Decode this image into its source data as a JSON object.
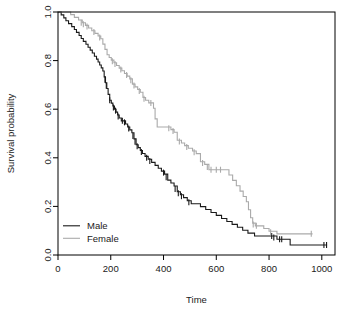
{
  "chart_data": {
    "type": "line",
    "plot_style": "kaplan-meier-step",
    "title": "",
    "xlabel": "Time",
    "ylabel": "Survival probability",
    "xlim": [
      0,
      1050
    ],
    "ylim": [
      0,
      1.0
    ],
    "xticks": [
      0,
      200,
      400,
      600,
      800,
      1000
    ],
    "xtick_labels": [
      "0",
      "200",
      "400",
      "600",
      "800",
      "1000"
    ],
    "yticks": [
      0.0,
      0.2,
      0.4,
      0.6,
      0.8,
      1.0
    ],
    "ytick_labels": [
      "0.0",
      "0.2",
      "0.4",
      "0.6",
      "0.8",
      "1.0"
    ],
    "grid": false,
    "legend_position": "bottom-left",
    "series": [
      {
        "name": "Male",
        "color": "#1a1a1a",
        "line_width": 1.1,
        "steps": [
          [
            0,
            1.0
          ],
          [
            12,
            0.988
          ],
          [
            22,
            0.976
          ],
          [
            30,
            0.964
          ],
          [
            40,
            0.952
          ],
          [
            52,
            0.94
          ],
          [
            62,
            0.928
          ],
          [
            70,
            0.916
          ],
          [
            80,
            0.903
          ],
          [
            88,
            0.891
          ],
          [
            96,
            0.879
          ],
          [
            106,
            0.867
          ],
          [
            114,
            0.855
          ],
          [
            122,
            0.843
          ],
          [
            130,
            0.831
          ],
          [
            138,
            0.818
          ],
          [
            146,
            0.806
          ],
          [
            152,
            0.794
          ],
          [
            158,
            0.782
          ],
          [
            164,
            0.77
          ],
          [
            170,
            0.757
          ],
          [
            175,
            0.733
          ],
          [
            180,
            0.709
          ],
          [
            185,
            0.685
          ],
          [
            190,
            0.661
          ],
          [
            196,
            0.637
          ],
          [
            202,
            0.625
          ],
          [
            208,
            0.613
          ],
          [
            214,
            0.6
          ],
          [
            220,
            0.588
          ],
          [
            226,
            0.576
          ],
          [
            232,
            0.564
          ],
          [
            240,
            0.552
          ],
          [
            248,
            0.552
          ],
          [
            256,
            0.539
          ],
          [
            264,
            0.527
          ],
          [
            272,
            0.515
          ],
          [
            280,
            0.503
          ],
          [
            288,
            0.478
          ],
          [
            296,
            0.454
          ],
          [
            304,
            0.442
          ],
          [
            312,
            0.43
          ],
          [
            320,
            0.418
          ],
          [
            330,
            0.406
          ],
          [
            342,
            0.394
          ],
          [
            355,
            0.381
          ],
          [
            368,
            0.369
          ],
          [
            380,
            0.357
          ],
          [
            392,
            0.345
          ],
          [
            404,
            0.333
          ],
          [
            416,
            0.308
          ],
          [
            428,
            0.296
          ],
          [
            440,
            0.284
          ],
          [
            452,
            0.26
          ],
          [
            464,
            0.248
          ],
          [
            476,
            0.236
          ],
          [
            490,
            0.223
          ],
          [
            505,
            0.211
          ],
          [
            520,
            0.211
          ],
          [
            540,
            0.199
          ],
          [
            560,
            0.187
          ],
          [
            580,
            0.175
          ],
          [
            600,
            0.163
          ],
          [
            620,
            0.15
          ],
          [
            640,
            0.138
          ],
          [
            660,
            0.126
          ],
          [
            680,
            0.114
          ],
          [
            700,
            0.102
          ],
          [
            720,
            0.09
          ],
          [
            745,
            0.078
          ],
          [
            770,
            0.078
          ],
          [
            800,
            0.078
          ],
          [
            830,
            0.065
          ],
          [
            860,
            0.065
          ],
          [
            880,
            0.041
          ],
          [
            1020,
            0.041
          ]
        ],
        "censor_marks": [
          [
            178,
            0.721
          ],
          [
            183,
            0.697
          ],
          [
            196,
            0.637
          ],
          [
            210,
            0.607
          ],
          [
            218,
            0.594
          ],
          [
            228,
            0.57
          ],
          [
            244,
            0.552
          ],
          [
            252,
            0.546
          ],
          [
            268,
            0.521
          ],
          [
            284,
            0.49
          ],
          [
            292,
            0.466
          ],
          [
            300,
            0.448
          ],
          [
            316,
            0.424
          ],
          [
            336,
            0.4
          ],
          [
            348,
            0.387
          ],
          [
            400,
            0.339
          ],
          [
            410,
            0.32
          ],
          [
            444,
            0.272
          ],
          [
            456,
            0.254
          ],
          [
            468,
            0.242
          ],
          [
            496,
            0.217
          ],
          [
            810,
            0.078
          ],
          [
            818,
            0.072
          ],
          [
            840,
            0.065
          ],
          [
            848,
            0.065
          ],
          [
            1008,
            0.041
          ],
          [
            1018,
            0.041
          ]
        ]
      },
      {
        "name": "Female",
        "color": "#aaaaaa",
        "line_width": 1.1,
        "steps": [
          [
            0,
            1.0
          ],
          [
            40,
            1.0
          ],
          [
            48,
            0.989
          ],
          [
            62,
            0.978
          ],
          [
            78,
            0.967
          ],
          [
            92,
            0.956
          ],
          [
            104,
            0.945
          ],
          [
            116,
            0.934
          ],
          [
            128,
            0.923
          ],
          [
            140,
            0.912
          ],
          [
            152,
            0.901
          ],
          [
            162,
            0.89
          ],
          [
            170,
            0.868
          ],
          [
            178,
            0.846
          ],
          [
            186,
            0.824
          ],
          [
            194,
            0.813
          ],
          [
            202,
            0.802
          ],
          [
            212,
            0.791
          ],
          [
            222,
            0.78
          ],
          [
            232,
            0.769
          ],
          [
            242,
            0.758
          ],
          [
            252,
            0.747
          ],
          [
            262,
            0.736
          ],
          [
            272,
            0.725
          ],
          [
            282,
            0.703
          ],
          [
            292,
            0.692
          ],
          [
            302,
            0.681
          ],
          [
            312,
            0.67
          ],
          [
            322,
            0.648
          ],
          [
            332,
            0.637
          ],
          [
            344,
            0.626
          ],
          [
            356,
            0.626
          ],
          [
            362,
            0.604
          ],
          [
            368,
            0.56
          ],
          [
            376,
            0.527
          ],
          [
            392,
            0.527
          ],
          [
            410,
            0.527
          ],
          [
            428,
            0.516
          ],
          [
            440,
            0.505
          ],
          [
            452,
            0.472
          ],
          [
            468,
            0.461
          ],
          [
            480,
            0.45
          ],
          [
            494,
            0.439
          ],
          [
            510,
            0.428
          ],
          [
            524,
            0.417
          ],
          [
            540,
            0.384
          ],
          [
            556,
            0.373
          ],
          [
            572,
            0.351
          ],
          [
            590,
            0.351
          ],
          [
            612,
            0.351
          ],
          [
            640,
            0.351
          ],
          [
            648,
            0.329
          ],
          [
            662,
            0.307
          ],
          [
            676,
            0.285
          ],
          [
            690,
            0.263
          ],
          [
            702,
            0.241
          ],
          [
            714,
            0.219
          ],
          [
            722,
            0.186
          ],
          [
            730,
            0.153
          ],
          [
            738,
            0.131
          ],
          [
            748,
            0.12
          ],
          [
            760,
            0.12
          ],
          [
            780,
            0.109
          ],
          [
            800,
            0.098
          ],
          [
            830,
            0.087
          ],
          [
            965,
            0.087
          ]
        ],
        "censor_marks": [
          [
            88,
            0.956
          ],
          [
            96,
            0.95
          ],
          [
            110,
            0.94
          ],
          [
            136,
            0.918
          ],
          [
            158,
            0.895
          ],
          [
            206,
            0.797
          ],
          [
            216,
            0.786
          ],
          [
            238,
            0.763
          ],
          [
            260,
            0.741
          ],
          [
            276,
            0.719
          ],
          [
            288,
            0.698
          ],
          [
            308,
            0.675
          ],
          [
            326,
            0.643
          ],
          [
            352,
            0.626
          ],
          [
            420,
            0.522
          ],
          [
            436,
            0.51
          ],
          [
            460,
            0.467
          ],
          [
            488,
            0.444
          ],
          [
            516,
            0.423
          ],
          [
            548,
            0.379
          ],
          [
            566,
            0.362
          ],
          [
            580,
            0.351
          ],
          [
            600,
            0.351
          ],
          [
            616,
            0.351
          ],
          [
            740,
            0.126
          ],
          [
            752,
            0.12
          ],
          [
            806,
            0.094
          ],
          [
            960,
            0.087
          ]
        ]
      }
    ],
    "legend_entries": [
      {
        "label": "Male",
        "color": "#1a1a1a"
      },
      {
        "label": "Female",
        "color": "#aaaaaa"
      }
    ]
  }
}
